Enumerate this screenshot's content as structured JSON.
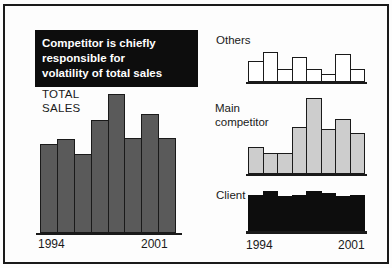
{
  "slide": {
    "headline_lines": [
      "Competitor is chiefly",
      "responsible for",
      "volatility of total sales"
    ],
    "colors": {
      "background": "#fdfdfd",
      "frame_border": "#1a1a1a",
      "headline_bg": "#0d0d0d",
      "headline_text": "#ffffff",
      "axis": "#1a1a1a",
      "total_sales_bar": "#5a5a5a",
      "others_bar": "#ffffff",
      "main_competitor_bar": "#cdcdcd",
      "client_bar": "#0d0d0d"
    }
  },
  "left_chart": {
    "title_lines": [
      "TOTAL",
      "SALES"
    ],
    "tick_start": "1994",
    "tick_end": "2001"
  },
  "right_charts": {
    "others_label": "Others",
    "main_label_lines": [
      "Main",
      "competitor"
    ],
    "client_label": "Client",
    "tick_start": "1994",
    "tick_end": "2001"
  },
  "chart_data": [
    {
      "id": "total-sales",
      "type": "bar",
      "title": "TOTAL SALES",
      "categories": [
        "1994",
        "1995",
        "1996",
        "1997",
        "1998",
        "1999",
        "2000",
        "2001"
      ],
      "values": [
        89,
        94,
        79,
        113,
        139,
        95,
        119,
        95
      ],
      "ylabel": "",
      "xlabel": "",
      "units": "unlabeled relative units (estimated from bar heights)",
      "ylim": [
        0,
        139
      ],
      "xtick_labels_shown": [
        "1994",
        "2001"
      ],
      "grid": false,
      "legend": false,
      "bar_fill": "#5a5a5a",
      "bar_outline": "#1a1a1a"
    },
    {
      "id": "others",
      "type": "bar",
      "title": "Others",
      "categories": [
        "1994",
        "1995",
        "1996",
        "1997",
        "1998",
        "1999",
        "2000",
        "2001"
      ],
      "values": [
        21,
        30,
        13,
        25,
        13,
        8,
        28,
        13
      ],
      "ylabel": "",
      "xlabel": "",
      "units": "unlabeled relative units (estimated from bar heights)",
      "ylim": [
        0,
        30
      ],
      "xtick_labels_shown": [],
      "grid": false,
      "legend": false,
      "bar_fill": "#ffffff",
      "bar_outline": "#1a1a1a"
    },
    {
      "id": "main-competitor",
      "type": "bar",
      "title": "Main competitor",
      "categories": [
        "1994",
        "1995",
        "1996",
        "1997",
        "1998",
        "1999",
        "2000",
        "2001"
      ],
      "values": [
        27,
        21,
        21,
        47,
        76,
        45,
        55,
        41
      ],
      "ylabel": "",
      "xlabel": "",
      "units": "unlabeled relative units (estimated from bar heights)",
      "ylim": [
        0,
        76
      ],
      "xtick_labels_shown": [],
      "grid": false,
      "legend": false,
      "bar_fill": "#cdcdcd",
      "bar_outline": "#1a1a1a"
    },
    {
      "id": "client",
      "type": "bar",
      "title": "Client",
      "categories": [
        "1994",
        "1995",
        "1996",
        "1997",
        "1998",
        "1999",
        "2000",
        "2001"
      ],
      "values": [
        36,
        40,
        35,
        36,
        40,
        38,
        35,
        36
      ],
      "ylabel": "",
      "xlabel": "",
      "units": "unlabeled relative units (estimated from bar heights)",
      "ylim": [
        0,
        40
      ],
      "xtick_labels_shown": [
        "1994",
        "2001"
      ],
      "grid": false,
      "legend": false,
      "bar_fill": "#0d0d0d",
      "bar_outline": "#0d0d0d"
    }
  ]
}
